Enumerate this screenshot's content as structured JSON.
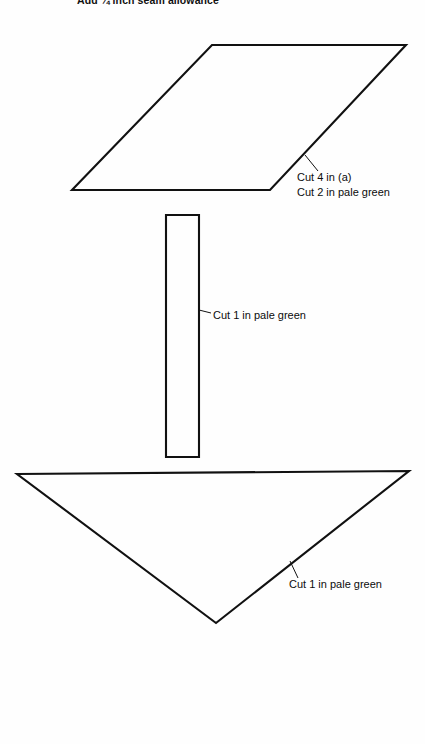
{
  "document": {
    "type": "sewing-pattern-diagram",
    "background_color": "#fefefe",
    "ink_color": "#111111",
    "heading": "Add ¼ inch seam allowance"
  },
  "pieces": [
    {
      "id": "parallelogram",
      "shape_name": "parallelogram-piece",
      "points": "212,45 406,45 270,190 72,190",
      "leader": "305,155 318,171",
      "labels": [
        "Cut 4 in (a)",
        "Cut 2 in pale green"
      ]
    },
    {
      "id": "rectangle",
      "shape_name": "rectangle-piece",
      "points": "166,215 199,215 199,457 166,457",
      "leader": "199,310 211,313",
      "labels": [
        "Cut 1 in pale green"
      ]
    },
    {
      "id": "triangle",
      "shape_name": "triangle-piece",
      "points": "17,474 409,471 216,623",
      "leader": "290,561 298,578",
      "labels": [
        "Cut 1 in pale green"
      ]
    }
  ]
}
